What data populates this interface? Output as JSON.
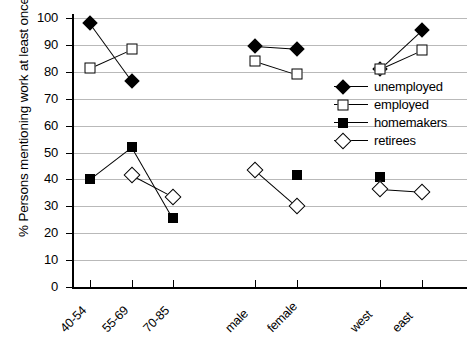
{
  "chart_data": {
    "type": "line",
    "title": "",
    "xlabel": "",
    "ylabel": "% Persons mentioning work at least once",
    "ylim": [
      0,
      100
    ],
    "ytick_step": 10,
    "yticks": [
      0,
      10,
      20,
      30,
      40,
      50,
      60,
      70,
      80,
      90,
      100
    ],
    "grid": true,
    "legend_position": "center-right",
    "categories": [
      "40-54",
      "55-69",
      "70-85",
      "male",
      "female",
      "west",
      "east"
    ],
    "category_groups": [
      {
        "name": "age",
        "categories": [
          "40-54",
          "55-69",
          "70-85"
        ]
      },
      {
        "name": "sex",
        "categories": [
          "male",
          "female"
        ]
      },
      {
        "name": "region",
        "categories": [
          "west",
          "east"
        ]
      }
    ],
    "series": [
      {
        "name": "unemployed",
        "marker": "filled-diamond",
        "values": [
          98,
          76.5,
          null,
          89.5,
          88.5,
          81,
          95.5
        ]
      },
      {
        "name": "employed",
        "marker": "open-square",
        "values": [
          81.5,
          88.5,
          null,
          84,
          79,
          81,
          88
        ]
      },
      {
        "name": "homemakers",
        "marker": "filled-square",
        "values": [
          40,
          52,
          25.5,
          null,
          41.5,
          41,
          null
        ]
      },
      {
        "name": "retirees",
        "marker": "open-diamond",
        "values": [
          null,
          41.5,
          33.5,
          43.5,
          30,
          36.5,
          35.5
        ]
      }
    ]
  },
  "axis": {
    "y_title": "% Persons mentioning work at least once",
    "y_tick_labels": [
      "100",
      "90",
      "80",
      "70",
      "60",
      "50",
      "40",
      "30",
      "20",
      "10",
      "0"
    ],
    "x_tick_labels": [
      "40-54",
      "55-69",
      "70-85",
      "male",
      "female",
      "west",
      "east"
    ]
  },
  "legend": {
    "items": [
      {
        "label": "unemployed",
        "marker": "filled-diamond"
      },
      {
        "label": "employed",
        "marker": "open-square"
      },
      {
        "label": "homemakers",
        "marker": "filled-square"
      },
      {
        "label": "retirees",
        "marker": "open-diamond"
      }
    ]
  },
  "colors": {
    "ink": "#000000",
    "gridline": "#b9b9b9",
    "background": "#ffffff"
  }
}
